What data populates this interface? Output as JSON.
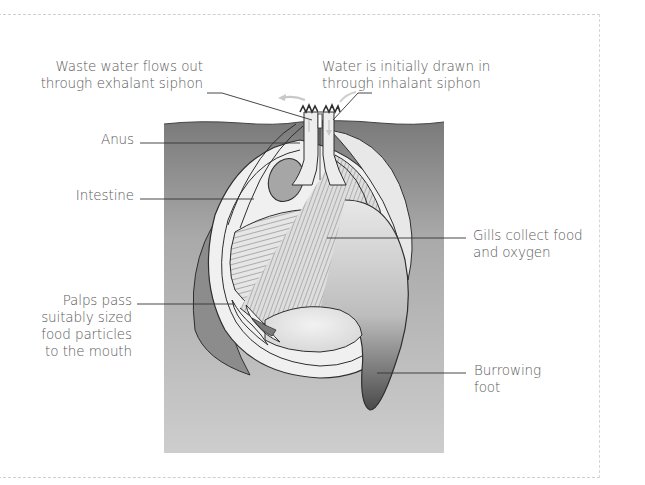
{
  "diagram": {
    "type": "labeled-anatomy",
    "labels": [
      {
        "id": "exhalant",
        "lines": [
          "Waste water flows out",
          "through exhalant siphon"
        ]
      },
      {
        "id": "inhalant",
        "lines": [
          "Water is initially drawn in",
          "through inhalant siphon"
        ]
      },
      {
        "id": "anus",
        "lines": [
          "Anus"
        ]
      },
      {
        "id": "intestine",
        "lines": [
          "Intestine"
        ]
      },
      {
        "id": "gills",
        "lines": [
          "Gills collect food",
          "and oxygen"
        ]
      },
      {
        "id": "palps",
        "lines": [
          "Palps pass",
          "suitably sized",
          "food particles",
          "to the mouth"
        ]
      },
      {
        "id": "foot",
        "lines": [
          "Burrowing",
          "foot"
        ]
      }
    ],
    "colors": {
      "label_text": "#5a5a5a",
      "leader_line": "#333333",
      "sediment_top": "#7d7d7d",
      "sediment_bottom": "#c9c9c9",
      "shell": "#efefef",
      "outline": "#2e2e2e",
      "flow_arrow": "#c8c8c8"
    }
  }
}
